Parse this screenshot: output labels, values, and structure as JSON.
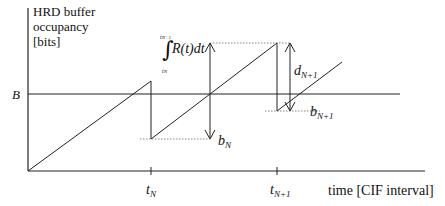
{
  "diagram": {
    "y_axis_label": [
      "HRD buffer",
      "occupancy",
      "[bits]"
    ],
    "x_axis_label": "time [CIF interval]",
    "buffer_level_label": "B",
    "ticks": [
      {
        "main": "t",
        "sub": "N"
      },
      {
        "main": "t",
        "sub": "N+1"
      }
    ],
    "integral": {
      "upper": "t",
      "upper_sub": "N+1",
      "lower": "t",
      "lower_sub": "N",
      "expression": "R(t)dt"
    },
    "annotations": {
      "b_N": {
        "main": "b",
        "sub": "N"
      },
      "d_N1": {
        "main": "d",
        "sub": "N+1"
      },
      "b_N1": {
        "main": "b",
        "sub": "N+1"
      }
    },
    "colors": {
      "line": "#222222",
      "dotted": "#555555"
    }
  }
}
